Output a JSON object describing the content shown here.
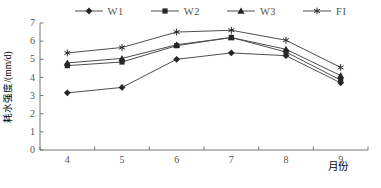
{
  "chart_data": {
    "type": "line",
    "categories": [
      4,
      5,
      6,
      7,
      8,
      9
    ],
    "series": [
      {
        "name": "W1",
        "marker": "diamond",
        "values": [
          3.15,
          3.45,
          5.0,
          5.35,
          5.2,
          3.7
        ]
      },
      {
        "name": "W2",
        "marker": "square",
        "values": [
          4.65,
          4.85,
          5.75,
          6.2,
          5.4,
          3.85
        ]
      },
      {
        "name": "W3",
        "marker": "triangle",
        "values": [
          4.8,
          5.05,
          5.8,
          6.2,
          5.55,
          4.1
        ]
      },
      {
        "name": "FI",
        "marker": "asterisk",
        "values": [
          5.35,
          5.65,
          6.5,
          6.6,
          6.05,
          4.55
        ]
      }
    ],
    "title": "",
    "xlabel": "月份",
    "ylabel": "耗水强度/(mm/d)",
    "xlim": [
      3.5,
      9.5
    ],
    "ylim": [
      0,
      7
    ],
    "ytick_step": 1,
    "ytick_labels": [
      "0",
      "1",
      "2",
      "3",
      "4",
      "5",
      "6",
      "7"
    ],
    "xtick_labels": [
      "4",
      "5",
      "6",
      "7",
      "8",
      "9"
    ],
    "grid": false,
    "legend_position": "top",
    "line_color": "#4f4f4f",
    "marker_color": "#262626",
    "axis_color": "#777770",
    "text_color": "#555550"
  }
}
